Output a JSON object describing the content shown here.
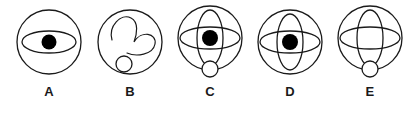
{
  "figure": {
    "type": "multiple-choice-figure-row",
    "background_color": "#ffffff",
    "stroke_color": "#1a1a1a",
    "fill_color": "#000000",
    "option_count": 5
  },
  "options": [
    {
      "label": "A",
      "name": "option-a",
      "elements": [
        "outer-circle",
        "horizontal-ellipse",
        "center-dot"
      ],
      "outer_circle": {
        "cx": 41,
        "cy": 38,
        "r": 32
      },
      "horizontal_ellipse": {
        "cx": 41,
        "cy": 38,
        "rx": 27,
        "ry": 11
      },
      "center_dot": {
        "cx": 41,
        "cy": 38,
        "r": 7.5
      },
      "vertical_ellipse": null,
      "small_circle": null
    },
    {
      "label": "B",
      "name": "option-b",
      "elements": [
        "outer-circle",
        "distorted-curve",
        "small-circle"
      ],
      "outer_circle": {
        "cx": 41,
        "cy": 38,
        "r": 32
      },
      "horizontal_ellipse": null,
      "center_dot": null,
      "vertical_ellipse": null,
      "small_circle": {
        "cx": 35,
        "cy": 60,
        "r": 8
      }
    },
    {
      "label": "C",
      "name": "option-c",
      "elements": [
        "outer-circle",
        "vertical-ellipse",
        "horizontal-ellipse",
        "center-dot",
        "small-circle"
      ],
      "outer_circle": {
        "cx": 41,
        "cy": 34,
        "r": 32
      },
      "horizontal_ellipse": {
        "cx": 41,
        "cy": 34,
        "rx": 30,
        "ry": 11
      },
      "vertical_ellipse": {
        "cx": 41,
        "cy": 34,
        "rx": 13,
        "ry": 28
      },
      "center_dot": {
        "cx": 41,
        "cy": 34,
        "r": 8
      },
      "small_circle": {
        "cx": 41,
        "cy": 65,
        "r": 8
      }
    },
    {
      "label": "D",
      "name": "option-d",
      "elements": [
        "outer-circle",
        "vertical-ellipse",
        "horizontal-ellipse",
        "center-dot"
      ],
      "outer_circle": {
        "cx": 41,
        "cy": 38,
        "r": 32
      },
      "horizontal_ellipse": {
        "cx": 41,
        "cy": 38,
        "rx": 30,
        "ry": 11
      },
      "vertical_ellipse": {
        "cx": 41,
        "cy": 38,
        "rx": 13,
        "ry": 28
      },
      "center_dot": {
        "cx": 41,
        "cy": 38,
        "r": 8
      },
      "small_circle": null
    },
    {
      "label": "E",
      "name": "option-e",
      "elements": [
        "outer-circle",
        "vertical-ellipse",
        "horizontal-ellipse",
        "small-circle"
      ],
      "outer_circle": {
        "cx": 41,
        "cy": 34,
        "r": 32
      },
      "horizontal_ellipse": {
        "cx": 41,
        "cy": 34,
        "rx": 30,
        "ry": 11
      },
      "vertical_ellipse": {
        "cx": 41,
        "cy": 34,
        "rx": 13,
        "ry": 28
      },
      "center_dot": null,
      "small_circle": {
        "cx": 41,
        "cy": 65,
        "r": 8
      }
    }
  ]
}
